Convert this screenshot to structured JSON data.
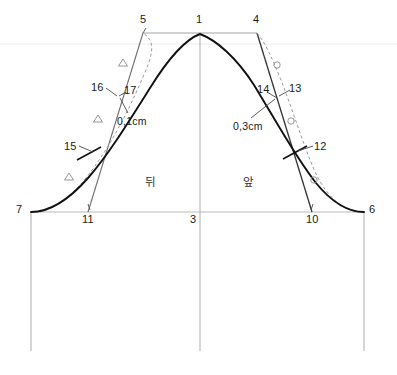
{
  "diagram": {
    "colors": {
      "main_curve": "#111111",
      "construction_line": "#6e6e6e",
      "guide_line": "#c8c8c8",
      "faint_line": "#e8e8e8",
      "dashed_curve": "#9a9a9a",
      "text": "#1a1a1a"
    },
    "points": [
      {
        "id": "1",
        "label": "1",
        "x": 200,
        "y": 33,
        "label_x": 196,
        "label_y": 17
      },
      {
        "id": "3",
        "label": "3",
        "x": 200,
        "y": 212,
        "label_x": 190,
        "label_y": 215
      },
      {
        "id": "4",
        "label": "4",
        "x": 257,
        "y": 33,
        "label_x": 253,
        "label_y": 17
      },
      {
        "id": "5",
        "label": "5",
        "x": 143,
        "y": 33,
        "label_x": 140,
        "label_y": 17
      },
      {
        "id": "6",
        "label": "6",
        "x": 364,
        "y": 212,
        "label_x": 370,
        "label_y": 205
      },
      {
        "id": "7",
        "label": "7",
        "x": 31,
        "y": 212,
        "label_x": 16,
        "label_y": 205
      },
      {
        "id": "10",
        "label": "10",
        "x": 312,
        "y": 212,
        "label_x": 306,
        "label_y": 215
      },
      {
        "id": "11",
        "label": "11",
        "x": 88,
        "y": 212,
        "label_x": 82,
        "label_y": 215
      },
      {
        "id": "12",
        "label": "12",
        "x": 295,
        "y": 152,
        "label_x": 314,
        "label_y": 142
      },
      {
        "id": "13",
        "label": "13",
        "x": 281,
        "y": 96,
        "label_x": 289,
        "label_y": 84
      },
      {
        "id": "14",
        "label": "14",
        "x": 275,
        "y": 98,
        "label_x": 258,
        "label_y": 85
      },
      {
        "id": "15",
        "label": "15",
        "x": 89,
        "y": 153,
        "label_x": 65,
        "label_y": 142
      },
      {
        "id": "16",
        "label": "16",
        "x": 115,
        "y": 97,
        "label_x": 92,
        "label_y": 83
      },
      {
        "id": "17",
        "label": "17",
        "x": 120,
        "y": 95,
        "label_x": 124,
        "label_y": 86
      }
    ],
    "dimensions": [
      {
        "id": "back-offset",
        "label": "0,1cm",
        "x": 118,
        "y": 117
      },
      {
        "id": "front-offset",
        "label": "0,3cm",
        "x": 234,
        "y": 122
      }
    ],
    "regions": [
      {
        "id": "back",
        "label": "뒤",
        "x": 145,
        "y": 178
      },
      {
        "id": "front",
        "label": "앞",
        "x": 243,
        "y": 178
      }
    ],
    "markers": {
      "back_notch_symbol": "triangle",
      "front_notch_symbol": "circle",
      "back_notches": [
        {
          "x": 123,
          "y": 63
        },
        {
          "x": 98,
          "y": 119
        },
        {
          "x": 69,
          "y": 177
        }
      ],
      "front_notches": [
        {
          "x": 277,
          "y": 65
        },
        {
          "x": 291,
          "y": 121
        },
        {
          "x": 314,
          "y": 180
        }
      ]
    },
    "geometry": {
      "baseline_y": 212,
      "top_line_y": 33,
      "faint_line_y": 44,
      "left_vertical_x": 31,
      "center_vertical_x": 200,
      "right_vertical_x": 364,
      "vertical_bottom_y": 351,
      "apex_x": 200,
      "apex_y": 33,
      "main_curve_path": "M 31 212 C 48 212 66 203 88 178 C 108 155 126 126 150 88 C 168 59 184 40 200 34 C 216 40 236 57 254 85 C 276 121 296 158 316 183 C 334 205 350 212 364 212",
      "back_dashed_path": "M 40 212 C 56 208 74 196 95 166 C 112 142 128 112 143 77 C 152 56 157 42 143 33",
      "front_dashed_path": "M 257 33 C 266 44 272 58 281 80 C 295 116 306 154 318 178 C 330 200 345 210 357 212",
      "back_construction_path": "M 143 33 L 88 212",
      "front_construction_path": "M 257 33 L 312 212",
      "top_guide_from_x": 143,
      "top_guide_to_x": 257
    },
    "tick_marks": [
      {
        "id": "tick-15",
        "x": 89,
        "y": 153,
        "angle": -62
      },
      {
        "id": "tick-12",
        "x": 295,
        "y": 152,
        "angle": 62
      }
    ],
    "leaders": [
      {
        "id": "leader-16",
        "x1": 106,
        "y1": 88,
        "x2": 118,
        "y2": 96
      },
      {
        "id": "leader-17",
        "x1": 126,
        "y1": 92,
        "x2": 119,
        "y2": 96
      },
      {
        "id": "leader-01",
        "x1": 126,
        "y1": 114,
        "x2": 120,
        "y2": 98
      },
      {
        "id": "leader-14",
        "x1": 266,
        "y1": 93,
        "x2": 276,
        "y2": 98
      },
      {
        "id": "leader-13",
        "x1": 290,
        "y1": 91,
        "x2": 279,
        "y2": 96
      },
      {
        "id": "leader-03",
        "x1": 252,
        "y1": 119,
        "x2": 275,
        "y2": 99
      },
      {
        "id": "leader-15",
        "x1": 79,
        "y1": 146,
        "x2": 92,
        "y2": 153
      },
      {
        "id": "leader-12",
        "x1": 312,
        "y1": 146,
        "x2": 297,
        "y2": 152
      },
      {
        "id": "leader-11",
        "x1": 90,
        "y1": 212,
        "x2": 88,
        "y2": 206
      }
    ]
  }
}
